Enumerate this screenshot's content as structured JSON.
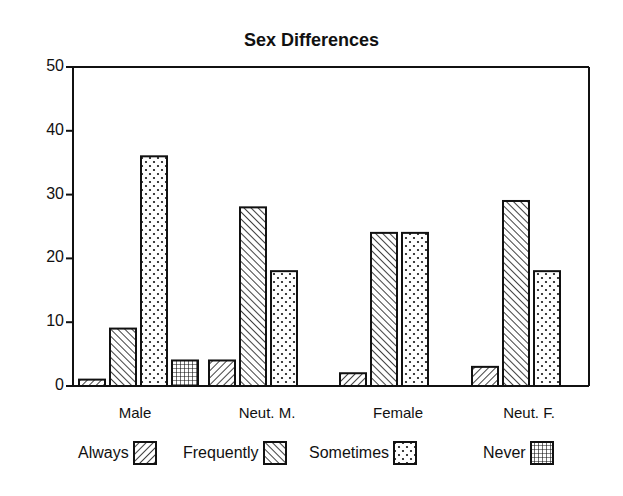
{
  "chart_data": {
    "type": "bar",
    "title": "Sex Differences",
    "xlabel": "",
    "ylabel": "",
    "ylim": [
      0,
      50
    ],
    "yticks": [
      0,
      10,
      20,
      30,
      40,
      50
    ],
    "grid": false,
    "legend_position": "bottom",
    "categories": [
      "Male",
      "Neut. M.",
      "Female",
      "Neut. F."
    ],
    "series": [
      {
        "name": "Always",
        "pattern": "diagonal-hatch-forward",
        "values": [
          1,
          4,
          2,
          3
        ]
      },
      {
        "name": "Frequently",
        "pattern": "diagonal-hatch-backward",
        "values": [
          9,
          28,
          24,
          29
        ]
      },
      {
        "name": "Sometimes",
        "pattern": "dots",
        "values": [
          36,
          18,
          24,
          18
        ]
      },
      {
        "name": "Never",
        "pattern": "grid",
        "values": [
          4,
          0,
          0,
          0
        ]
      }
    ]
  },
  "labels": {
    "title": "Sex Differences",
    "yticks": [
      "0",
      "10",
      "20",
      "30",
      "40",
      "50"
    ],
    "categories": [
      "Male",
      "Neut. M.",
      "Female",
      "Neut. F."
    ],
    "legend": [
      "Always",
      "Frequently",
      "Sometimes",
      "Never"
    ]
  }
}
